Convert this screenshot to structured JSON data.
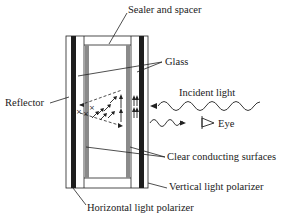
{
  "diagram": {
    "title": "",
    "type": "liquid-crystal-display-cross-section",
    "labels": {
      "sealer": "Sealer and spacer",
      "glass": "Glass",
      "reflector": "Reflector",
      "incident_light": "Incident light",
      "eye": "Eye",
      "clear_conducting": "Clear conducting surfaces",
      "vertical_polarizer": "Vertical light polarizer",
      "horizontal_polarizer": "Horizontal light polarizer"
    },
    "colors": {
      "ink": "#1a1a1a",
      "polarizer": "#1e1e1e",
      "conducting_surface": "#8a8a8a",
      "background": "#ffffff"
    }
  }
}
